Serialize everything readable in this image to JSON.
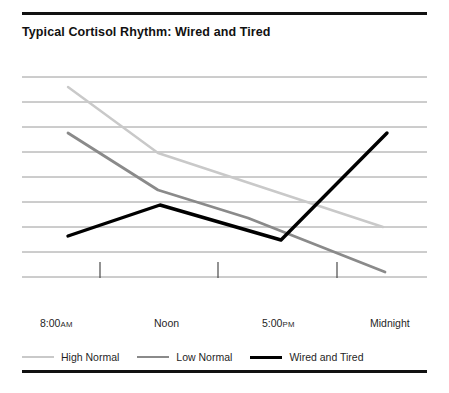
{
  "page": {
    "title": "Typical Cortisol Rhythm: Wired and Tired"
  },
  "rules": {
    "top_label": "top-divider",
    "bottom_label": "bottom-divider"
  },
  "axis": {
    "tick_labels": [
      {
        "text": "8:00",
        "meridiem": "AM",
        "x": 18
      },
      {
        "text": "Noon",
        "meridiem": "",
        "x": 132
      },
      {
        "text": "5:00",
        "meridiem": "PM",
        "x": 240
      },
      {
        "text": "Midnight",
        "meridiem": "",
        "x": 348
      }
    ]
  },
  "legend": {
    "items": [
      {
        "label": "High Normal",
        "color": "#c9c9c9",
        "swatch": "sw-high"
      },
      {
        "label": "Low Normal",
        "color": "#8a8a8a",
        "swatch": "sw-low"
      },
      {
        "label": "Wired and Tired",
        "color": "#000000",
        "swatch": "sw-wired"
      }
    ]
  },
  "chart_data": {
    "type": "line",
    "title": "Typical Cortisol Rhythm: Wired and Tired",
    "xlabel": "",
    "ylabel": "",
    "x": [
      "8:00 AM",
      "Noon",
      "5:00 PM",
      "Midnight"
    ],
    "xlim": [
      0,
      3
    ],
    "ylim": [
      0,
      8
    ],
    "grid": true,
    "y_gridlines": 9,
    "y_tick_labels": [],
    "legend_position": "bottom-left",
    "note": "y-axis is unlabeled; values are relative cortisol level read off the 9 evenly spaced gridlines (gridline 8 = top, gridline 0 = bottom).",
    "series": [
      {
        "name": "High Normal",
        "color": "#c9c9c9",
        "points": [
          {
            "x": "8:00 AM",
            "y": 7.6
          },
          {
            "x": "Noon",
            "y": 4.95
          },
          {
            "x": "Midnight",
            "y": 2.0
          }
        ]
      },
      {
        "name": "Low Normal",
        "color": "#8a8a8a",
        "points": [
          {
            "x": "8:00 AM",
            "y": 5.75
          },
          {
            "x": "Noon",
            "y": 3.5
          },
          {
            "x": "2:00 PM",
            "y": 2.35
          },
          {
            "x": "Midnight",
            "y": 0.2
          }
        ]
      },
      {
        "name": "Wired and Tired",
        "color": "#000000",
        "points": [
          {
            "x": "8:00 AM",
            "y": 1.65
          },
          {
            "x": "Noon",
            "y": 2.9
          },
          {
            "x": "5:00 PM",
            "y": 1.5
          },
          {
            "x": "Midnight",
            "y": 5.75
          }
        ]
      }
    ]
  },
  "geometry": {
    "grid": {
      "x1": 22,
      "x2": 427,
      "y_start": 77,
      "y_step": 25,
      "count": 9,
      "color": "#9a9a9a"
    },
    "ticks": {
      "y1": 262,
      "y2": 278,
      "xs": [
        100,
        218,
        337
      ],
      "color": "#4a4a4a"
    },
    "paths": {
      "high_normal": "M 68,87 L 158,153 L 383,227",
      "low_normal": "M 68,133 L 158,190 L 248,218 L 385,272",
      "wired_and_tired": "M 68,236 L 160,205 L 281,240 L 387,133"
    }
  }
}
